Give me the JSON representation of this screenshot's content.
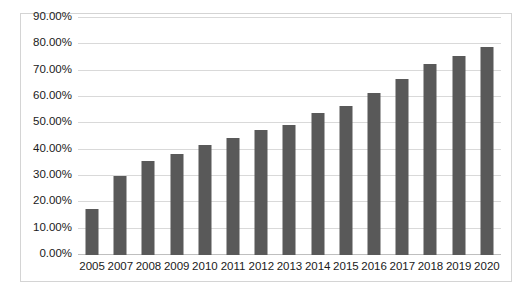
{
  "chart_data": {
    "type": "bar",
    "title": "",
    "subtitle": "",
    "xlabel": "",
    "ylabel": "",
    "categories": [
      "2005",
      "2007",
      "2008",
      "2009",
      "2010",
      "2011",
      "2012",
      "2013",
      "2014",
      "2015",
      "2016",
      "2017",
      "2018",
      "2019",
      "2020"
    ],
    "values": [
      17.5,
      30.0,
      35.6,
      38.4,
      41.6,
      44.4,
      47.5,
      49.5,
      54.0,
      56.5,
      61.5,
      66.8,
      72.5,
      75.5,
      79.0
    ],
    "value_labels": [
      "17.50%",
      "30.00%",
      "35.60%",
      "38.40%",
      "41.60%",
      "44.40%",
      "47.50%",
      "49.50%",
      "54.00%",
      "56.50%",
      "61.50%",
      "66.80%",
      "72.50%",
      "75.50%",
      "79.00%"
    ],
    "ylim": [
      0,
      90
    ],
    "ytick_values": [
      0,
      10,
      20,
      30,
      40,
      50,
      60,
      70,
      80,
      90
    ],
    "ytick_labels": [
      "0.00%",
      "10.00%",
      "20.00%",
      "30.00%",
      "40.00%",
      "50.00%",
      "60.00%",
      "70.00%",
      "80.00%",
      "90.00%"
    ],
    "grid": true,
    "legend": false,
    "legend_position": "none",
    "series": [
      {
        "name": "",
        "color": "#595959",
        "values": [
          17.5,
          30.0,
          35.6,
          38.4,
          41.6,
          44.4,
          47.5,
          49.5,
          54.0,
          56.5,
          61.5,
          66.8,
          72.5,
          75.5,
          79.0
        ]
      }
    ],
    "colors": {
      "bar": "#595959",
      "gridline": "#d9d9d9",
      "axis": "#bfbfbf",
      "border": "#d4d4d4",
      "text": "#1a1a1a",
      "background": "#ffffff"
    }
  }
}
